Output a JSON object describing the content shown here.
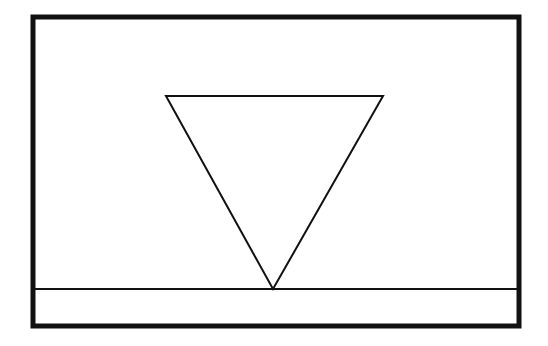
{
  "diagram": {
    "colors": {
      "background": "#ffffff",
      "stroke": "#111111"
    },
    "frame": {
      "x": 33,
      "y": 17,
      "width": 486,
      "height": 309,
      "stroke_width": 5
    },
    "ground_line": {
      "x1": 33,
      "y1": 289,
      "x2": 519,
      "y2": 289,
      "stroke_width": 2
    },
    "triangle": {
      "points": "166,96 383,96 273,289",
      "orientation": "inverted",
      "stroke_width": 2
    }
  }
}
